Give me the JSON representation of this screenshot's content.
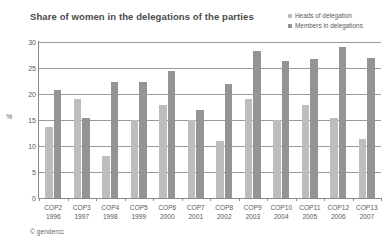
{
  "chart_data": {
    "type": "bar",
    "title": "Share of women in the delegations of the parties",
    "xlabel": "",
    "ylabel": "%",
    "ylim": [
      0,
      30
    ],
    "yticks": [
      0,
      5,
      10,
      15,
      20,
      25,
      30
    ],
    "grid": true,
    "legend_position": "top-right",
    "categories": [
      "COP2",
      "COP3",
      "COP4",
      "COP5",
      "COP6",
      "COP7",
      "COP8",
      "COP9",
      "COP10",
      "COP11",
      "COP12",
      "COP13"
    ],
    "category_years": [
      "1996",
      "1997",
      "1998",
      "1999",
      "2000",
      "2001",
      "2002",
      "2003",
      "2004",
      "2005",
      "2006",
      "2007"
    ],
    "series": [
      {
        "name": "Heads of delegation",
        "color": "#bdbdbd",
        "values": [
          13.7,
          19.0,
          8.0,
          15.0,
          17.8,
          15.0,
          11.0,
          19.0,
          15.0,
          17.8,
          15.4,
          11.4
        ]
      },
      {
        "name": "Members in delegations",
        "color": "#949494",
        "values": [
          20.7,
          15.4,
          22.3,
          22.3,
          24.4,
          17.0,
          22.0,
          28.3,
          26.4,
          26.8,
          29.0,
          27.0
        ]
      }
    ]
  },
  "footer": {
    "copyright_symbol": "©",
    "credit": "gendercc"
  }
}
